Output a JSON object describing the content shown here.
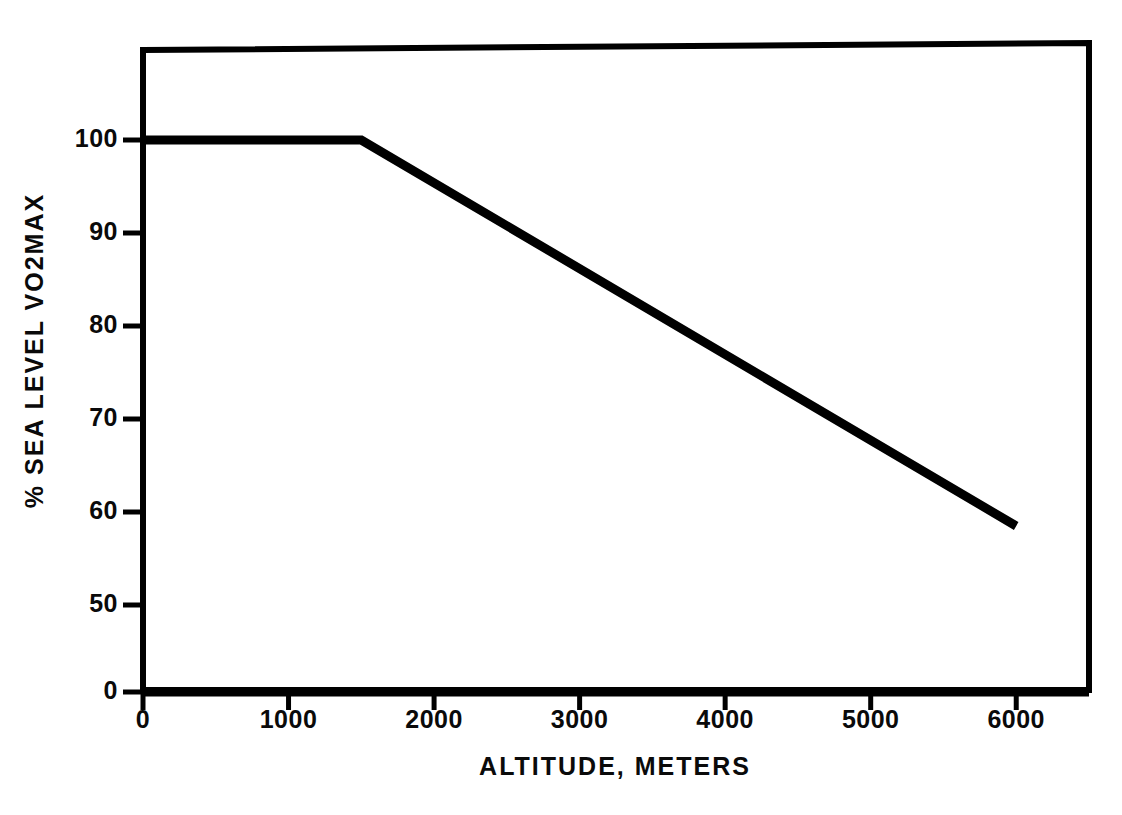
{
  "chart_data": {
    "type": "line",
    "title": "",
    "xlabel": "ALTITUDE, METERS",
    "ylabel": "% SEA LEVEL VO2MAX",
    "xlim": [
      0,
      6500
    ],
    "ylim": [
      0,
      100
    ],
    "y_axis_broken": true,
    "y_break_note": "axis jumps from 0 to 50",
    "grid": false,
    "legend": null,
    "xticks": [
      0,
      1000,
      2000,
      3000,
      4000,
      5000,
      6000
    ],
    "xtick_labels": [
      "0",
      "1000",
      "2000",
      "3000",
      "4000",
      "5000",
      "6000"
    ],
    "yticks": [
      0,
      50,
      60,
      70,
      80,
      90,
      100
    ],
    "ytick_labels": [
      "0",
      "50",
      "60",
      "70",
      "80",
      "90",
      "100"
    ],
    "series": [
      {
        "name": "% sea level VO2max vs altitude",
        "x": [
          0,
          1500,
          6000
        ],
        "values": [
          100,
          100,
          58.5
        ]
      }
    ],
    "line_color": "#000000",
    "frame_color": "#000000"
  },
  "axis": {
    "x_title": "ALTITUDE, METERS",
    "y_title": "% SEA LEVEL VO2MAX"
  }
}
